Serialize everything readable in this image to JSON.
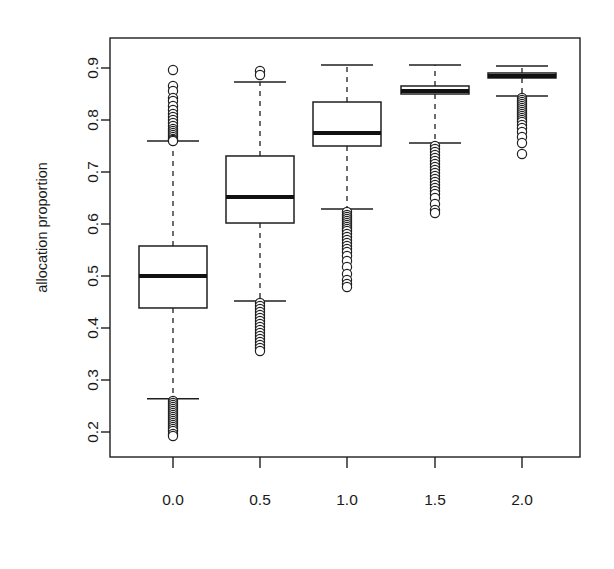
{
  "chart_data": {
    "type": "box",
    "title": "",
    "xlabel": "",
    "ylabel": "allocation proportion",
    "x_tick_labels": [
      "0.0",
      "0.5",
      "1.0",
      "1.5",
      "2.0"
    ],
    "x_positions": [
      0.0,
      0.5,
      1.0,
      1.5,
      2.0
    ],
    "y_tick_labels": [
      "0.2",
      "0.3",
      "0.4",
      "0.5",
      "0.6",
      "0.7",
      "0.8",
      "0.9"
    ],
    "y_ticks": [
      0.2,
      0.3,
      0.4,
      0.5,
      0.6,
      0.7,
      0.8,
      0.9
    ],
    "ylim": [
      0.175,
      0.915
    ],
    "grid": false,
    "legend": false,
    "boxes": [
      {
        "label": "0.0",
        "x": 0.0,
        "whisker_low": 0.264,
        "q1": 0.4385,
        "median": 0.5,
        "q3": 0.5577,
        "whisker_high": 0.7596,
        "outliers_high": [
          0.8962,
          0.8654,
          0.8558,
          0.8423,
          0.8365,
          0.8269,
          0.8192,
          0.8115,
          0.8058,
          0.8,
          0.7942,
          0.7885,
          0.7827,
          0.7788,
          0.775,
          0.7712,
          0.7673,
          0.7635,
          0.7615,
          0.7596
        ],
        "outliers_low": [
          0.2596,
          0.2558,
          0.2519,
          0.2481,
          0.2442,
          0.2404,
          0.2365,
          0.2327,
          0.2288,
          0.225,
          0.2212,
          0.2173,
          0.2135,
          0.2096,
          0.2058,
          0.2019,
          0.1962,
          0.1923
        ]
      },
      {
        "label": "0.5",
        "x": 0.5,
        "whisker_low": 0.4519,
        "q1": 0.6019,
        "median": 0.6519,
        "q3": 0.7308,
        "whisker_high": 0.8731,
        "outliers_high": [
          0.8942,
          0.8865
        ],
        "outliers_low": [
          0.4481,
          0.4423,
          0.4365,
          0.4308,
          0.425,
          0.4192,
          0.4135,
          0.4077,
          0.4019,
          0.3962,
          0.3904,
          0.3846,
          0.3788,
          0.3731,
          0.3673,
          0.3615,
          0.3558
        ]
      },
      {
        "label": "1.0",
        "x": 1.0,
        "whisker_low": 0.6288,
        "q1": 0.75,
        "median": 0.775,
        "q3": 0.8346,
        "whisker_high": 0.9058,
        "outliers_high": [],
        "outliers_low": [
          0.6231,
          0.6173,
          0.6135,
          0.6096,
          0.6058,
          0.6019,
          0.5981,
          0.5942,
          0.5904,
          0.5865,
          0.5808,
          0.575,
          0.5692,
          0.5635,
          0.5577,
          0.5519,
          0.5462,
          0.5385,
          0.5288,
          0.5173,
          0.5038,
          0.4923,
          0.4846,
          0.4788
        ]
      },
      {
        "label": "1.5",
        "x": 1.5,
        "whisker_low": 0.7558,
        "q1": 0.85,
        "median": 0.8558,
        "q3": 0.8654,
        "whisker_high": 0.9058,
        "outliers_high": [],
        "outliers_low": [
          0.75,
          0.7442,
          0.7385,
          0.7327,
          0.7269,
          0.7212,
          0.7154,
          0.7096,
          0.7038,
          0.6981,
          0.6923,
          0.6865,
          0.6808,
          0.675,
          0.6692,
          0.6635,
          0.6577,
          0.65,
          0.6385,
          0.6269,
          0.6212
        ]
      },
      {
        "label": "2.0",
        "x": 2.0,
        "whisker_low": 0.8462,
        "q1": 0.8808,
        "median": 0.8846,
        "q3": 0.8904,
        "whisker_high": 0.9038,
        "outliers_high": [],
        "outliers_low": [
          0.8423,
          0.8385,
          0.8346,
          0.8308,
          0.8269,
          0.8231,
          0.8192,
          0.8154,
          0.8115,
          0.8077,
          0.8038,
          0.8,
          0.7962,
          0.7904,
          0.7846,
          0.7769,
          0.7673,
          0.7558,
          0.7346
        ]
      }
    ]
  },
  "colors": {
    "line": "#1f1f1f",
    "median": "#111111",
    "background": "#ffffff",
    "text": "#1a1a1a"
  }
}
